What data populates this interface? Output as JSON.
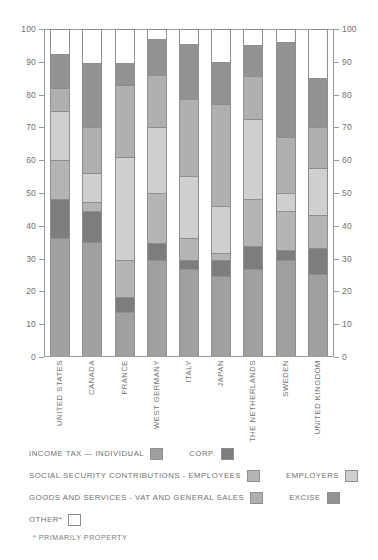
{
  "chart_data": {
    "type": "bar",
    "title": "",
    "subtitle": "",
    "xlabel": "",
    "ylabel": "",
    "ylim": [
      0,
      100
    ],
    "yticks": [
      0,
      10,
      20,
      30,
      40,
      50,
      60,
      70,
      80,
      90,
      100
    ],
    "ytick_labels": [
      "0",
      "10",
      "20",
      "30",
      "40",
      "50",
      "60",
      "70",
      "80",
      "90",
      "100"
    ],
    "grid": false,
    "stacked": true,
    "dual_axis": true,
    "legend_position": "below",
    "categories": [
      "UNITED STATES",
      "CANADA",
      "FRANCE",
      "WEST GERMANY",
      "ITALY",
      "JAPAN",
      "THE NETHERLANDS",
      "SWEDEN",
      "UNITED KINGDOM"
    ],
    "series": [
      {
        "name": "INCOME TAX — INDIVIDUAL",
        "color": "#a0a0a0",
        "values": [
          36.0,
          35.0,
          13.5,
          29.5,
          26.5,
          24.5,
          26.5,
          29.5,
          25.0
        ]
      },
      {
        "name": "CORP.",
        "color": "#7d7d7d",
        "values": [
          12.0,
          9.5,
          4.5,
          5.0,
          3.0,
          5.0,
          7.0,
          3.0,
          8.0
        ]
      },
      {
        "name": "SOCIAL SECURITY CONTRIBUTIONS - EMPLOYEES",
        "color": "#b4b4b4",
        "values": [
          12.0,
          2.5,
          11.5,
          15.5,
          6.5,
          2.0,
          14.5,
          12.0,
          10.0
        ]
      },
      {
        "name": "EMPLOYERS",
        "color": "#cfcfcf",
        "values": [
          15.0,
          9.0,
          31.5,
          20.0,
          19.0,
          14.5,
          24.5,
          5.5,
          14.5
        ]
      },
      {
        "name": "GOODS AND SERVICES - VAT AND GENERAL SALES",
        "color": "#b0b0b0",
        "values": [
          7.0,
          14.0,
          22.0,
          16.0,
          23.5,
          31.0,
          13.0,
          17.0,
          12.5
        ]
      },
      {
        "name": "EXCISE",
        "color": "#939393",
        "values": [
          10.5,
          19.5,
          6.5,
          11.0,
          17.0,
          13.0,
          9.5,
          29.0,
          15.0
        ]
      },
      {
        "name": "OTHER*",
        "color": "#ffffff",
        "values": [
          7.5,
          10.5,
          10.5,
          3.0,
          4.5,
          10.0,
          5.0,
          4.0,
          15.0
        ]
      }
    ],
    "bar_tops": [
      100,
      100,
      100,
      100,
      100,
      100,
      100,
      100,
      100
    ],
    "footnote": "* PRIMARILY PROPERTY"
  },
  "axis": {
    "left_labels": [
      "100",
      "90",
      "80",
      "70",
      "60",
      "50",
      "40",
      "30",
      "20",
      "10",
      "0"
    ],
    "right_labels": [
      "100",
      "90",
      "80",
      "70",
      "60",
      "50",
      "40",
      "30",
      "20",
      "10",
      "0"
    ]
  },
  "legend": {
    "rows": [
      {
        "entries": [
          {
            "label": "INCOME TAX — INDIVIDUAL",
            "color": "#a0a0a0",
            "swatch_name": "income-tax-individual"
          },
          {
            "label": "CORP.",
            "color": "#7d7d7d",
            "swatch_name": "income-tax-corp"
          }
        ]
      },
      {
        "entries": [
          {
            "label": "SOCIAL SECURITY CONTRIBUTIONS - EMPLOYEES",
            "color": "#b4b4b4",
            "swatch_name": "social-security-employees"
          },
          {
            "label": "EMPLOYERS",
            "color": "#cfcfcf",
            "swatch_name": "social-security-employers"
          }
        ]
      },
      {
        "entries": [
          {
            "label": "GOODS AND SERVICES - VAT AND GENERAL SALES",
            "color": "#b0b0b0",
            "swatch_name": "goods-services-vat"
          },
          {
            "label": "EXCISE",
            "color": "#939393",
            "swatch_name": "goods-services-excise"
          }
        ]
      },
      {
        "entries": [
          {
            "label": "OTHER*",
            "color": "#ffffff",
            "swatch_name": "other"
          }
        ]
      }
    ],
    "footnote": "* PRIMARILY PROPERTY"
  },
  "colors": {
    "axis": "#9a9a9a",
    "segment_border": "#8e8e8e",
    "text": "#6f6f6f",
    "background": "#ffffff"
  }
}
